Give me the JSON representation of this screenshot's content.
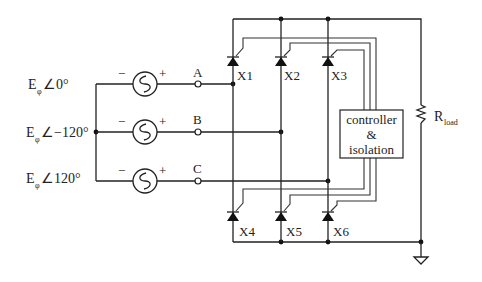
{
  "diagram": {
    "sources": [
      {
        "id": "A",
        "label_main": "E",
        "label_sub": "φ",
        "label_angle": "∠0°",
        "minus": "−",
        "plus": "+",
        "terminal": "A"
      },
      {
        "id": "B",
        "label_main": "E",
        "label_sub": "φ",
        "label_angle": "∠−120°",
        "minus": "−",
        "plus": "+",
        "terminal": "B"
      },
      {
        "id": "C",
        "label_main": "E",
        "label_sub": "φ",
        "label_angle": "∠120°",
        "minus": "−",
        "plus": "+",
        "terminal": "C"
      }
    ],
    "thyristors_top": [
      "X1",
      "X2",
      "X3"
    ],
    "thyristors_bottom": [
      "X4",
      "X5",
      "X6"
    ],
    "controller": {
      "line1": "controller",
      "line2": "&",
      "line3": "isolation"
    },
    "load": {
      "label_main": "R",
      "label_sub": "load"
    }
  }
}
